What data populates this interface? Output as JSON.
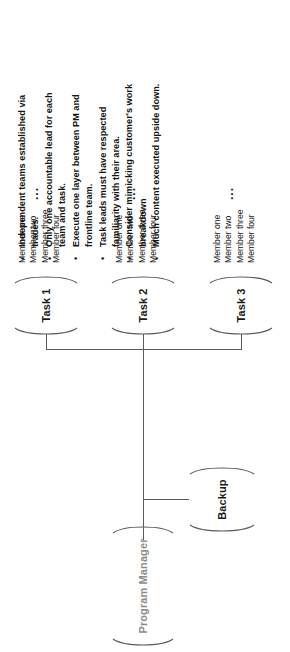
{
  "diagram": {
    "type": "org-chart",
    "root": {
      "label": "Program Manager",
      "style": "muted"
    },
    "backup": {
      "label": "Backup"
    },
    "tasks": [
      {
        "label": "Task 1",
        "members": [
          "Member one",
          "Member two",
          "Member three",
          "Member four"
        ],
        "more": "..."
      },
      {
        "label": "Task 2",
        "members": [
          "Member one",
          "Member two",
          "Member three",
          "Member four"
        ],
        "more": "..."
      },
      {
        "label": "Task 3",
        "members": [
          "Member one",
          "Member two",
          "Member three",
          "Member four"
        ],
        "more": "..."
      }
    ]
  },
  "notes": {
    "bullet_glyph": "•",
    "items": [
      "Independent teams established via trades.",
      "Only one accountable lead for each team and task.",
      "Execute one layer between PM and frontline team.",
      "Task leads must have respected familiarity with their area.",
      "Consider mimicking customer's work breakdown",
      "Much content executed upside down."
    ]
  },
  "colors": {
    "line": "#5a5a5a",
    "text": "#1a1a1a",
    "muted_text": "#8c8c8c",
    "background": "#ffffff"
  }
}
